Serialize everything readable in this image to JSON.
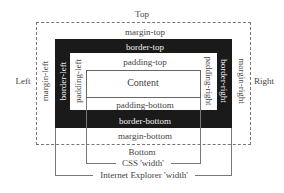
{
  "diagram": {
    "outer_labels": {
      "top": "Top",
      "bottom": "Bottom",
      "left": "Left",
      "right": "Right"
    },
    "margin": {
      "top": "margin-top",
      "bottom": "margin-bottom",
      "left": "margin-left",
      "right": "margin-right"
    },
    "border": {
      "top": "border-top",
      "bottom": "border-bottom",
      "left": "border-left",
      "right": "border-right"
    },
    "padding": {
      "top": "padding-top",
      "bottom": "padding-bottom",
      "left": "padding-left",
      "right": "padding-right"
    },
    "content": "Content",
    "width_labels": {
      "css": "CSS 'width'",
      "ie": "Internet Explorer 'width'"
    },
    "colors": {
      "border_fill": "#1a1a1a",
      "line": "#777777",
      "text": "#444444",
      "border_text": "#f2f2f2"
    }
  }
}
